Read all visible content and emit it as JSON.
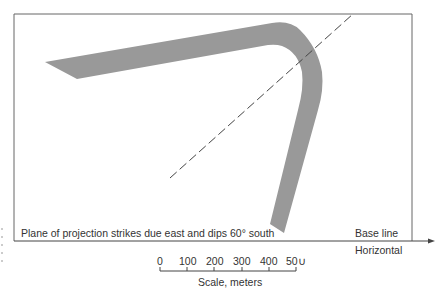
{
  "diagram": {
    "caption": "Plane of projection strikes due east and dips 60° south",
    "base_line_label": "Base line",
    "horizontal_label": "Horizontal",
    "scale": {
      "ticks": [
        "0",
        "100",
        "200",
        "300",
        "400",
        "50∪"
      ],
      "label": "Scale, meters"
    },
    "colors": {
      "band": "#999999",
      "frame": "#555555",
      "dashed": "#444444"
    }
  }
}
